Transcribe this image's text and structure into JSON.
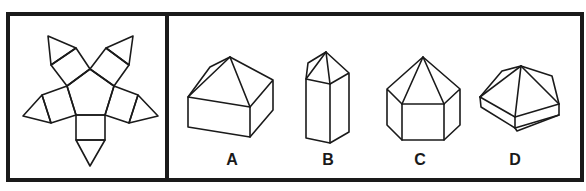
{
  "puzzle": {
    "question_panel": {
      "figure": "pentagon-net",
      "description": "Unfolded net: central pentagon with a square on each edge, each capped by a triangle"
    },
    "options": [
      {
        "label": "A",
        "figure": "square-prism-with-pyramid-top"
      },
      {
        "label": "B",
        "figure": "tall-pentagonal-prism-with-pyramid-top"
      },
      {
        "label": "C",
        "figure": "hexagonal-prism-with-pyramid-top"
      },
      {
        "label": "D",
        "figure": "pentagonal-prism-with-pyramid-top"
      }
    ]
  },
  "colors": {
    "line": "#1a1a1a",
    "background": "#ffffff"
  }
}
